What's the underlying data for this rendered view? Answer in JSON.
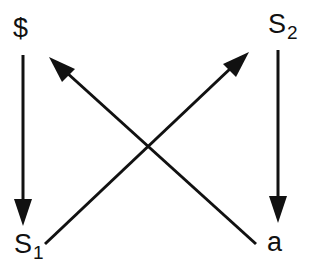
{
  "diagram": {
    "nodes": [
      {
        "id": "dollar",
        "label": "$",
        "subscript": ""
      },
      {
        "id": "s2",
        "label": "S",
        "subscript": "2"
      },
      {
        "id": "s1",
        "label": "S",
        "subscript": "1"
      },
      {
        "id": "a",
        "label": "a",
        "subscript": ""
      }
    ],
    "edges": [
      {
        "from": "$",
        "to": "S1",
        "direction": "down"
      },
      {
        "from": "S2",
        "to": "a",
        "direction": "down"
      },
      {
        "from": "S1",
        "to": "S2",
        "direction": "diagonal-up-right"
      },
      {
        "from": "a",
        "to": "$",
        "direction": "diagonal-up-left"
      }
    ],
    "colors": {
      "line": "#111111",
      "background": "#ffffff"
    }
  }
}
